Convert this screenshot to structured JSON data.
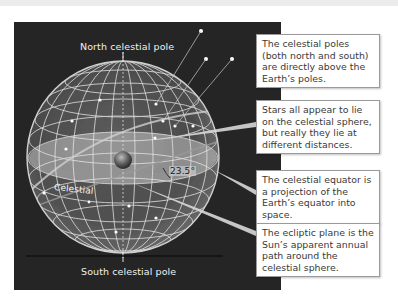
{
  "figure": {
    "labels": {
      "north_pole": "North celestial pole",
      "south_pole": "South celestial pole",
      "angle": "23.5°",
      "equator_label": "Celestial"
    },
    "callouts": [
      {
        "text": "The celestial poles (both north and south) are directly above the Earth’s poles."
      },
      {
        "text": "Stars all appear to lie on the celestial sphere, but really they lie at different distances."
      },
      {
        "text": "The celestial equator is a projection of the Earth’s equator into space."
      },
      {
        "text": "The ecliptic plane is the Sun’s apparent annual path around the celestial sphere."
      }
    ],
    "colors": {
      "panel_background": "#252525",
      "callout_background": "#ffffff",
      "callout_border": "#9a9a9a",
      "grid_lines": "#e8e8e8",
      "equator_band": "#b8b8b8"
    }
  }
}
